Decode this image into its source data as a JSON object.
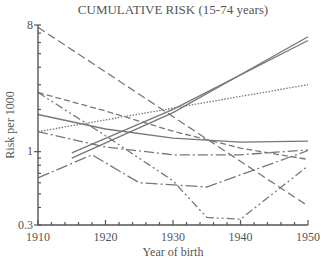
{
  "chart_data": {
    "type": "line",
    "title": "CUMULATIVE RISK (15-74 years)",
    "xlabel": "Year of birth",
    "ylabel": "Risk per 1000",
    "xlim": [
      1910,
      1950
    ],
    "ylim": [
      0.3,
      8
    ],
    "yscale": "log",
    "x_ticks": [
      1910,
      1920,
      1930,
      1940,
      1950
    ],
    "y_ticks": [
      0.3,
      1,
      8
    ],
    "x_tick_labels": [
      "1910",
      "1920",
      "1930",
      "1940",
      "1950"
    ],
    "y_tick_labels": [
      "0.3",
      "1",
      "8"
    ],
    "grid": false,
    "legend": null,
    "series": [
      {
        "name": "series-long-dash",
        "style": "8,4",
        "x": [
          1910,
          1950
        ],
        "values": [
          7.7,
          0.41
        ]
      },
      {
        "name": "series-double-solid-a",
        "style": "solid",
        "x": [
          1915,
          1930,
          1950
        ],
        "values": [
          0.9,
          1.9,
          6.6
        ]
      },
      {
        "name": "series-double-solid-b",
        "style": "solid",
        "x": [
          1915,
          1930,
          1950
        ],
        "values": [
          0.98,
          2.0,
          6.2
        ]
      },
      {
        "name": "series-dotted",
        "style": "1.5,1.5",
        "x": [
          1910,
          1950
        ],
        "values": [
          1.39,
          3.0
        ]
      },
      {
        "name": "series-solid",
        "style": "solid",
        "x": [
          1910,
          1920,
          1930,
          1940,
          1950
        ],
        "values": [
          1.84,
          1.45,
          1.25,
          1.17,
          1.19
        ]
      },
      {
        "name": "series-dash-dot-upper",
        "style": "10,3,2,3",
        "x": [
          1910,
          1920,
          1930,
          1940,
          1950
        ],
        "values": [
          1.39,
          1.08,
          0.95,
          0.95,
          1.03
        ]
      },
      {
        "name": "series-dashed",
        "style": "6,3",
        "x": [
          1910,
          1920,
          1930,
          1940,
          1950
        ],
        "values": [
          2.64,
          1.95,
          1.4,
          1.06,
          0.88
        ]
      },
      {
        "name": "series-dash-dot-dot",
        "style": "8,3,2,3,2,3",
        "x": [
          1910,
          1920,
          1930,
          1935,
          1940,
          1950
        ],
        "values": [
          2.64,
          1.3,
          0.62,
          0.34,
          0.33,
          0.79
        ]
      },
      {
        "name": "series-long-dash-dot-lower",
        "style": "12,3,2,3",
        "x": [
          1910,
          1918,
          1925,
          1935,
          1950
        ],
        "values": [
          0.65,
          0.95,
          0.6,
          0.56,
          1.02
        ]
      }
    ]
  }
}
